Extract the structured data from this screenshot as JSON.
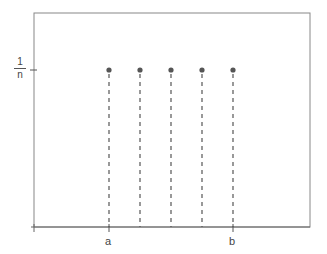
{
  "chart_data": {
    "type": "scatter",
    "title": "",
    "xlabel": "",
    "ylabel": "",
    "x_tick_labels": [
      "a",
      "b"
    ],
    "y_tick_labels": [
      "1/n"
    ],
    "y_tick_label_numerator": "1",
    "y_tick_label_denominator": "n",
    "points": [
      {
        "x": 1,
        "y": "1/n"
      },
      {
        "x": 2,
        "y": "1/n"
      },
      {
        "x": 3,
        "y": "1/n"
      },
      {
        "x": 4,
        "y": "1/n"
      },
      {
        "x": 5,
        "y": "1/n"
      }
    ],
    "x_label_positions": {
      "a": 1,
      "b": 5
    },
    "stems": "dashed vertical lines from each point to x-axis",
    "grid": false,
    "legend": null
  }
}
